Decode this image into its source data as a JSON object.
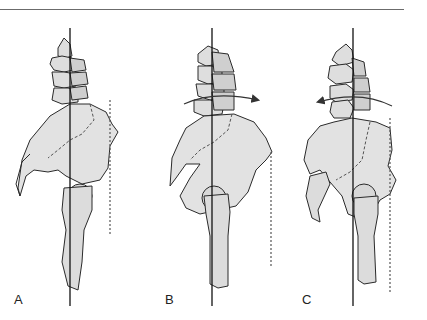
{
  "figure": {
    "type": "anatomical-diagram",
    "colors": {
      "bone_fill": "#e2e2e2",
      "bone_shade": "#cfcfcf",
      "outline": "#2a2a2a",
      "line": "#111111",
      "dashed": "#555555"
    },
    "panels": [
      {
        "id": "A",
        "label": "A",
        "rotation_arrow": "none"
      },
      {
        "id": "B",
        "label": "B",
        "rotation_arrow": "clockwise-right"
      },
      {
        "id": "C",
        "label": "C",
        "rotation_arrow": "counterclockwise-left"
      }
    ]
  }
}
